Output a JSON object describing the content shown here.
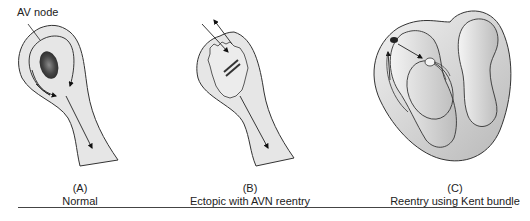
{
  "figure": {
    "panels": [
      {
        "id": "A",
        "letter": "(A)",
        "title": "Normal",
        "callout": "AV node"
      },
      {
        "id": "B",
        "letter": "(B)",
        "title": "Ectopic with AVN reentry"
      },
      {
        "id": "C",
        "letter": "(C)",
        "title": "Reentry using Kent bundle"
      }
    ]
  },
  "colors": {
    "tissue_fill": "#e6e6e6",
    "outline": "#333333",
    "node_dark": "#3a3a3a",
    "heart_shade": "#c8c8c8"
  }
}
